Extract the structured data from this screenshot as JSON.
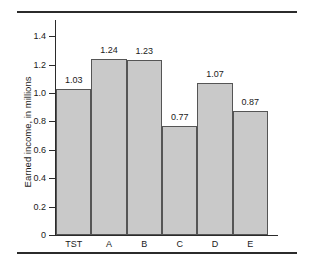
{
  "chart_data": {
    "type": "bar",
    "title": "",
    "xlabel": "",
    "ylabel": "Earned income, in millions",
    "categories": [
      "TST",
      "A",
      "B",
      "C",
      "D",
      "E"
    ],
    "values": [
      1.03,
      1.24,
      1.23,
      0.77,
      1.07,
      0.87
    ],
    "value_labels": [
      "1.03",
      "1.24",
      "1.23",
      "0.77",
      "1.07",
      "0.87"
    ],
    "ylim": [
      0,
      1.5
    ],
    "ytick_values": [
      0,
      0.2,
      0.4,
      0.6,
      0.8,
      1.0,
      1.2,
      1.4
    ],
    "ytick_labels": [
      "0",
      "0.2",
      "0.4",
      "0.6",
      "0.8",
      "1.0",
      "1.2",
      "1.4"
    ],
    "grid": false,
    "legend": null,
    "bar_color": "#c9c9c9",
    "bar_edge_color": "#555555",
    "axis_color": "#2b2b2b",
    "background": "#ffffff"
  }
}
